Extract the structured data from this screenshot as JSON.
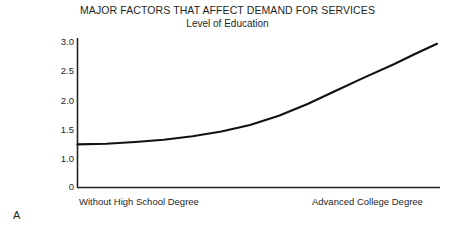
{
  "chart_data": {
    "type": "line",
    "title": "MAJOR FACTORS THAT AFFECT DEMAND FOR SERVICES",
    "subtitle": "Level of Education",
    "xlabel": "",
    "ylabel": "Average Visits Per Year",
    "panel_label": "A",
    "grid": false,
    "legend": "none",
    "line_color": "#111111",
    "axis_color": "#222222",
    "background_color": "#ffffff",
    "y_ticks": [
      "3.0",
      "2.5",
      "2.0",
      "1.5",
      "1.0",
      "0"
    ],
    "y_tick_values": [
      3.0,
      2.5,
      2.0,
      1.5,
      1.0,
      0
    ],
    "ylim": [
      0,
      3.0
    ],
    "y_axis_broken_below": 1.0,
    "x_tick_labels": [
      "Without High School Degree",
      "Advanced College Degree"
    ],
    "x_categories": [
      "Without High School Degree",
      "Advanced College Degree"
    ],
    "x": [
      0,
      0.08,
      0.16,
      0.24,
      0.32,
      0.4,
      0.48,
      0.56,
      0.64,
      0.72,
      0.8,
      0.88,
      0.94,
      1.0
    ],
    "values": [
      1.25,
      1.26,
      1.29,
      1.33,
      1.39,
      1.47,
      1.58,
      1.74,
      1.94,
      2.17,
      2.4,
      2.62,
      2.8,
      2.97
    ],
    "series": [
      {
        "name": "Average visits per year",
        "values": [
          1.25,
          1.26,
          1.29,
          1.33,
          1.39,
          1.47,
          1.58,
          1.74,
          1.94,
          2.17,
          2.4,
          2.62,
          2.8,
          2.97
        ]
      }
    ]
  }
}
